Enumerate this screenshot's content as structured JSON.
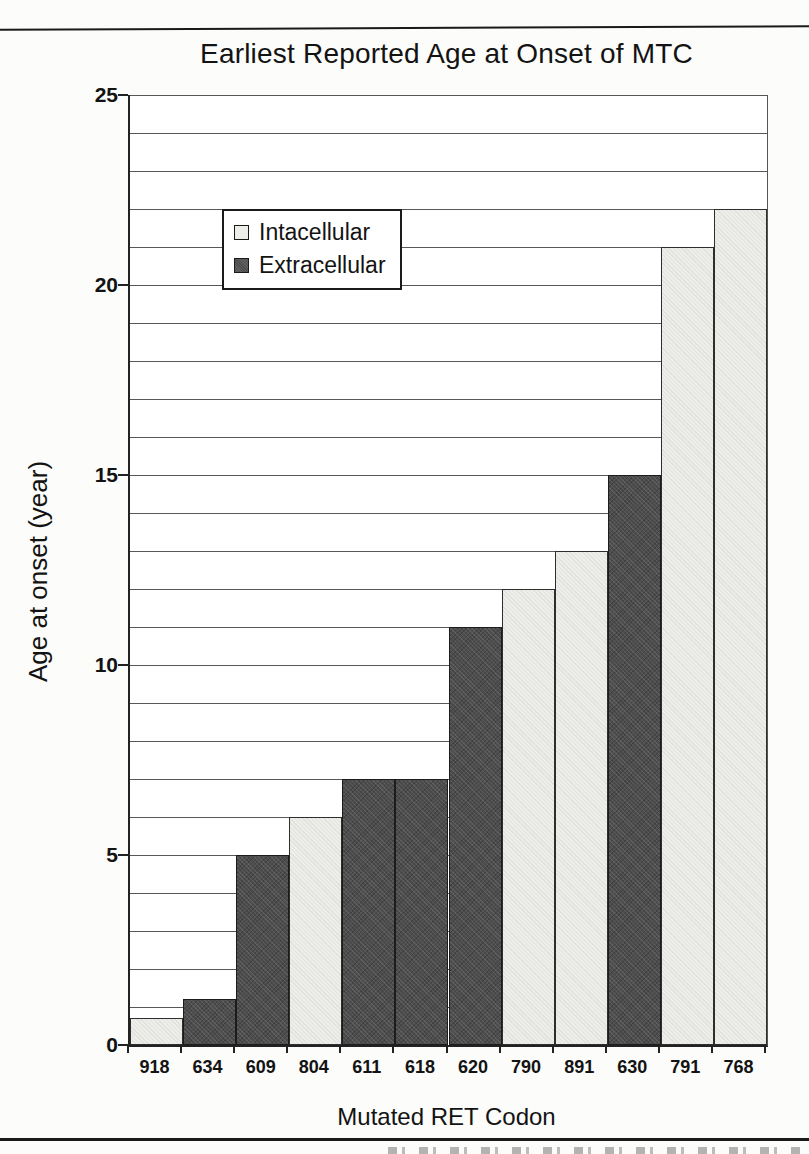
{
  "chart_data": {
    "type": "bar",
    "title": "Earliest Reported Age at Onset of MTC",
    "xlabel": "Mutated RET Codon",
    "ylabel": "Age at onset (year)",
    "ylim": [
      0,
      25
    ],
    "y_major_ticks": [
      25,
      20,
      15,
      10,
      5,
      0
    ],
    "gridline_interval": 1,
    "grid": "on",
    "legend_position": "upper-left-inside",
    "legend": [
      {
        "label": "Intacellular",
        "color": "#edede9"
      },
      {
        "label": "Extracellular",
        "color": "#4d4d4d"
      }
    ],
    "categories": [
      "918",
      "634",
      "609",
      "804",
      "611",
      "618",
      "620",
      "790",
      "891",
      "630",
      "791",
      "768"
    ],
    "values": [
      0.7,
      1.2,
      5,
      6,
      7,
      7,
      11,
      12,
      13,
      15,
      21,
      22
    ],
    "series_membership": [
      "Intacellular",
      "Extracellular",
      "Extracellular",
      "Intacellular",
      "Extracellular",
      "Extracellular",
      "Extracellular",
      "Intacellular",
      "Intacellular",
      "Extracellular",
      "Intacellular",
      "Intacellular"
    ]
  }
}
